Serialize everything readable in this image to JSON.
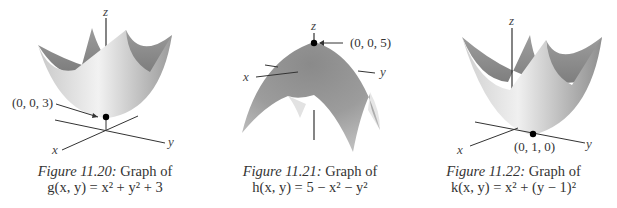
{
  "figures": [
    {
      "number": "Figure 11.20:",
      "caption_text": " Graph of",
      "formula": "g(x, y) = x² + y² + 3",
      "point_label": "(0, 0, 3)",
      "axes": {
        "x": "x",
        "y": "y",
        "z": "z"
      },
      "surface": "paraboloid-up"
    },
    {
      "number": "Figure 11.21:",
      "caption_text": " Graph of",
      "formula": "h(x, y) = 5 − x² − y²",
      "point_label": "(0, 0, 5)",
      "axes": {
        "x": "x",
        "y": "y",
        "z": "z"
      },
      "surface": "paraboloid-down"
    },
    {
      "number": "Figure 11.22:",
      "caption_text": " Graph of",
      "formula": "k(x, y) = x² + (y − 1)²",
      "point_label": "(0, 1, 0)",
      "axes": {
        "x": "x",
        "y": "y",
        "z": "z"
      },
      "surface": "paraboloid-up-shifted"
    }
  ],
  "colors": {
    "surface_light": "#e8e8e8",
    "surface_mid": "#b0b0b0",
    "surface_dark": "#7a7a7a",
    "axis": "#333333",
    "point": "#000000"
  }
}
